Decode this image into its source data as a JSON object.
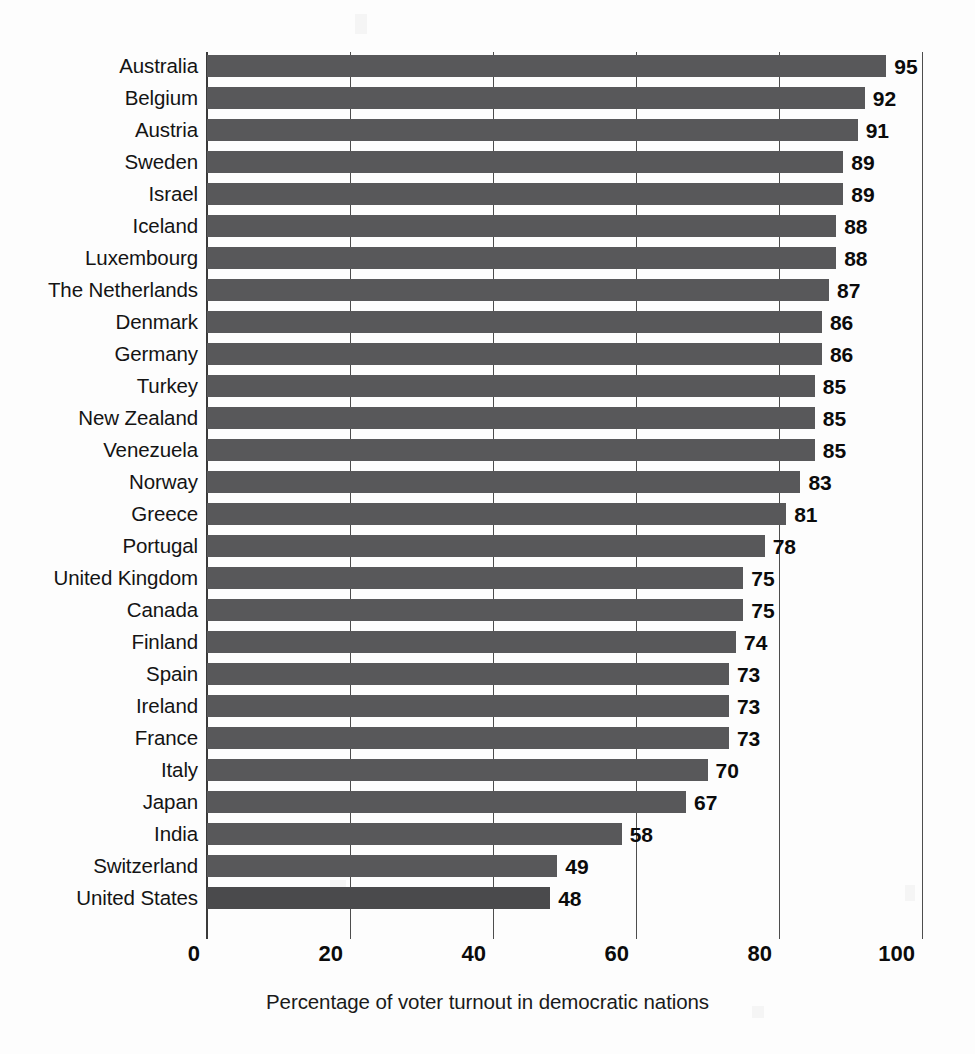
{
  "chart_data": {
    "type": "bar",
    "orientation": "horizontal",
    "title": "",
    "xlabel": "Percentage of voter turnout in democratic nations",
    "ylabel": "",
    "xlim": [
      0,
      100
    ],
    "xticks": [
      0,
      20,
      40,
      60,
      80,
      100
    ],
    "grid": true,
    "legend": null,
    "bar_color": "#58585a",
    "highlight_color": "#4a4a4c",
    "highlight_category": "United States",
    "categories": [
      "Australia",
      "Belgium",
      "Austria",
      "Sweden",
      "Israel",
      "Iceland",
      "Luxembourg",
      "The Netherlands",
      "Denmark",
      "Germany",
      "Turkey",
      "New Zealand",
      "Venezuela",
      "Norway",
      "Greece",
      "Portugal",
      "United Kingdom",
      "Canada",
      "Finland",
      "Spain",
      "Ireland",
      "France",
      "Italy",
      "Japan",
      "India",
      "Switzerland",
      "United States"
    ],
    "values": [
      95,
      92,
      91,
      89,
      89,
      88,
      88,
      87,
      86,
      86,
      85,
      85,
      85,
      83,
      81,
      78,
      75,
      75,
      74,
      73,
      73,
      73,
      70,
      67,
      58,
      49,
      48
    ]
  }
}
